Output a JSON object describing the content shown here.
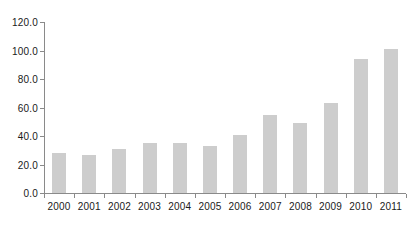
{
  "chart_data": {
    "type": "bar",
    "title": "",
    "subtitle": "",
    "xlabel": "",
    "ylabel": "",
    "categories": [
      "2000",
      "2001",
      "2002",
      "2003",
      "2004",
      "2005",
      "2006",
      "2007",
      "2008",
      "2009",
      "2010",
      "2011"
    ],
    "values": [
      28.0,
      27.0,
      31.0,
      35.0,
      35.0,
      33.0,
      41.0,
      55.0,
      49.0,
      63.0,
      94.0,
      101.0
    ],
    "series": [
      {
        "name": "",
        "values": [
          28.0,
          27.0,
          31.0,
          35.0,
          35.0,
          33.0,
          41.0,
          55.0,
          49.0,
          63.0,
          94.0,
          101.0
        ]
      }
    ],
    "ylim": [
      0.0,
      120.0
    ],
    "y_ticks": [
      0.0,
      20.0,
      40.0,
      60.0,
      80.0,
      100.0,
      120.0
    ],
    "y_tick_labels": [
      "0.0",
      "20.0",
      "40.0",
      "60.0",
      "80.0",
      "100.0",
      "120.0"
    ],
    "x_tick_labels": [
      "2000",
      "2001",
      "2002",
      "2003",
      "2004",
      "2005",
      "2006",
      "2007",
      "2008",
      "2009",
      "2010",
      "2011"
    ],
    "grid": false,
    "legend": null,
    "legend_position": "none",
    "annotations": [],
    "bar_color": "#cdcdcd",
    "axis_color": "#8a8a8a",
    "text_color": "#1a1a1a",
    "background_color": "#ffffff"
  }
}
